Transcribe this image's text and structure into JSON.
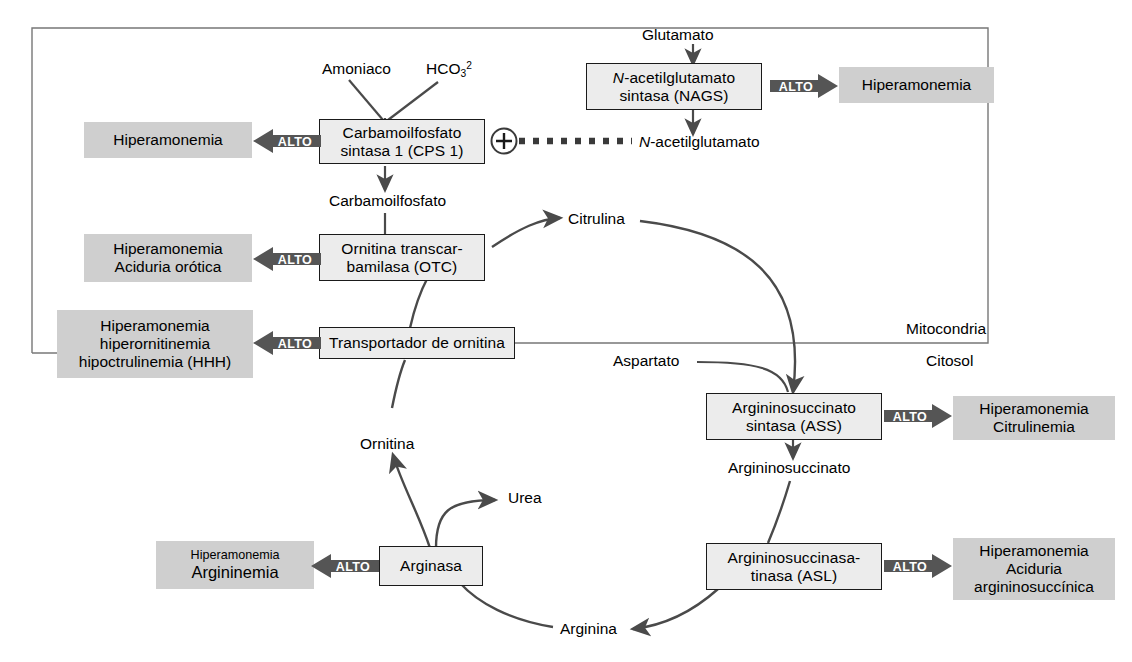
{
  "figure": {
    "compartments": {
      "mitochondria_label": "Mitocondria",
      "cytosol_label": "Citosol"
    },
    "colors": {
      "enzyme_box_fill": "#ececec",
      "disease_box_fill": "#cfcfcf",
      "arrow_stroke": "#4a4a4a",
      "alto_arrow_fill": "#555555",
      "alto_text": "#ffffff",
      "border": "#1a1a1a"
    }
  },
  "enzymes": [
    {
      "id": "cps1",
      "line1": "Carbamoilfosfato",
      "line2": "sintasa 1 (CPS 1)"
    },
    {
      "id": "nags",
      "line1": "N-acetilglutamato",
      "line2": "sintasa (NAGS)",
      "italic_prefix": "N"
    },
    {
      "id": "otc",
      "line1": "Ornitina transcar-",
      "line2": "bamilasa (OTC)"
    },
    {
      "id": "ornt",
      "line1": "Transportador de ornitina",
      "line2": ""
    },
    {
      "id": "ass",
      "line1": "Argininosuccinato",
      "line2": "sintasa (ASS)"
    },
    {
      "id": "asl",
      "line1": "Argininosuccinasa-",
      "line2": "tinasa (ASL)"
    },
    {
      "id": "arginasa",
      "line1": "Arginasa",
      "line2": ""
    }
  ],
  "diseases": [
    {
      "id": "cps1-dis",
      "lines": [
        "Hiperamonemia"
      ]
    },
    {
      "id": "nags-dis",
      "lines": [
        "Hiperamonemia"
      ]
    },
    {
      "id": "otc-dis",
      "lines": [
        "Hiperamonemia",
        "Aciduria orótica"
      ]
    },
    {
      "id": "hhh-dis",
      "lines": [
        "Hiperamonemia",
        "hiperornitinemia",
        "hipoctrulinemia (HHH)"
      ]
    },
    {
      "id": "ass-dis",
      "lines": [
        "Hiperamonemia",
        "Citrulinemia"
      ]
    },
    {
      "id": "asl-dis",
      "lines": [
        "Hiperamonemia",
        "Aciduria",
        "argininosuccínica"
      ]
    },
    {
      "id": "arg-dis",
      "lines": [
        "Hiperamonemia",
        "Argininemia"
      ]
    }
  ],
  "alto_label": "ALTO",
  "metabolites": {
    "amoniaco": "Amoniaco",
    "bicarbonato_text": "HCO3",
    "bicarbonato_sub": "3",
    "bicarbonato_sup": "2",
    "bicarbonato_base": "HCO",
    "glutamato": "Glutamato",
    "n_acetilglutamato": "-acetilglutamato",
    "n_acetilglutamato_prefix": "N",
    "carbamoilfosfato": "Carbamoilfosfato",
    "citrulina": "Citrulina",
    "aspartato": "Aspartato",
    "argininosuccinato": "Argininosuccinato",
    "arginina": "Arginina",
    "ornitina": "Ornitina",
    "urea": "Urea"
  },
  "symbols": {
    "plus": "+"
  }
}
